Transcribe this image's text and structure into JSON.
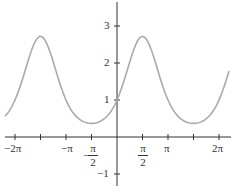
{
  "chart_data": {
    "type": "line",
    "title": "",
    "function": "y = e^(sin x)",
    "xlabel": "",
    "ylabel": "",
    "xlim": [
      -6.9,
      6.9
    ],
    "ylim": [
      -1.2,
      3.6
    ],
    "grid": false,
    "legend": null,
    "x_tick_labels": [
      "-2π",
      "-π",
      "-π/2",
      "π/2",
      "π",
      "2π"
    ],
    "x_ticks_values": [
      -6.2832,
      -4.7124,
      -3.1416,
      -1.5708,
      1.5708,
      3.1416,
      4.7124,
      6.2832
    ],
    "y_tick_labels": [
      "3",
      "2",
      "1",
      "-1"
    ],
    "y_ticks_values": [
      3,
      2,
      1,
      -1
    ],
    "series": [
      {
        "name": "e^(sin x)",
        "color": "#aaaaaa",
        "x": [
          -6.9,
          -6.2832,
          -5.4978,
          -4.7124,
          -3.927,
          -3.1416,
          -2.3562,
          -1.5708,
          -0.7854,
          0,
          0.7854,
          1.5708,
          2.3562,
          3.1416,
          3.927,
          4.7124,
          5.4978,
          6.2832,
          6.9
        ],
        "values": [
          0.58,
          1.0,
          2.03,
          2.718,
          2.03,
          1.0,
          0.49,
          0.368,
          0.49,
          1.0,
          2.03,
          2.718,
          2.03,
          1.0,
          0.49,
          0.368,
          0.49,
          1.0,
          1.81
        ]
      }
    ],
    "annotations": {
      "maxima": [
        {
          "x": -4.7124,
          "y": 2.718
        },
        {
          "x": 1.5708,
          "y": 2.718
        }
      ],
      "minima": [
        {
          "x": -1.5708,
          "y": 0.368
        },
        {
          "x": 4.7124,
          "y": 0.368
        }
      ],
      "y_intercept": {
        "x": 0,
        "y": 1
      }
    }
  },
  "labels": {
    "x": {
      "neg2pi": "−2π",
      "negpi": "−π",
      "neghalfpi_sign": "−",
      "neghalfpi_num": "π",
      "neghalfpi_den": "2",
      "halfpi_num": "π",
      "halfpi_den": "2",
      "pi": "π",
      "twopi": "2π"
    },
    "y": {
      "three": "3",
      "two": "2",
      "one": "1",
      "negone": "−1"
    }
  }
}
